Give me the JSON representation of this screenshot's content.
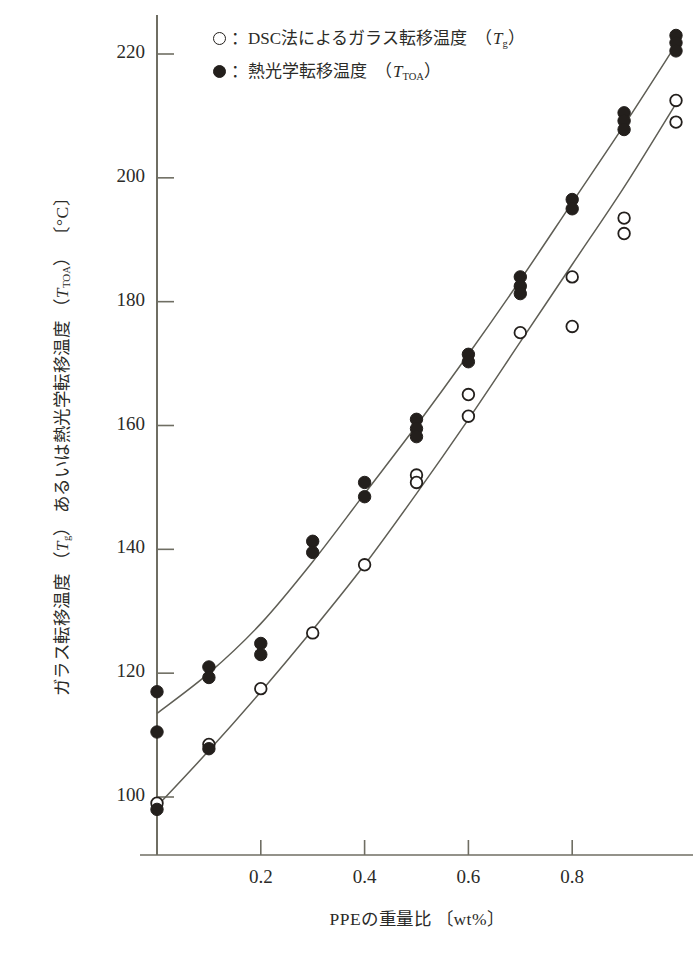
{
  "chart_data": {
    "type": "scatter",
    "title": "",
    "xlabel": "PPEの重量比 〔wt%〕",
    "ylabel": "ガラス転移温度 (Tg) あるいは熱光学転移温度 (TTOA) 〔°C〕",
    "xlim": [
      0.0,
      1.0
    ],
    "ylim": [
      94,
      226
    ],
    "xticks": [
      0.2,
      0.4,
      0.6,
      0.8
    ],
    "xtick_labels": [
      "0.2",
      "0.4",
      "0.6",
      "0.8"
    ],
    "yticks": [
      100,
      120,
      140,
      160,
      180,
      200,
      220
    ],
    "ytick_labels": [
      "100",
      "120",
      "140",
      "160",
      "180",
      "200",
      "220"
    ],
    "grid": false,
    "legend_position": "top-center",
    "series": [
      {
        "name": "DSC法によるガラス転移温度 (Tg)",
        "marker": "open-circle",
        "color": "#231f1c",
        "points": [
          {
            "x": 0.0,
            "y": 99.0
          },
          {
            "x": 0.1,
            "y": 108.5
          },
          {
            "x": 0.2,
            "y": 117.5
          },
          {
            "x": 0.3,
            "y": 126.5
          },
          {
            "x": 0.4,
            "y": 137.5
          },
          {
            "x": 0.5,
            "y": 152.0
          },
          {
            "x": 0.5,
            "y": 150.8
          },
          {
            "x": 0.6,
            "y": 165.0
          },
          {
            "x": 0.6,
            "y": 161.5
          },
          {
            "x": 0.7,
            "y": 175.0
          },
          {
            "x": 0.8,
            "y": 184.0
          },
          {
            "x": 0.8,
            "y": 176.0
          },
          {
            "x": 0.9,
            "y": 193.5
          },
          {
            "x": 0.9,
            "y": 191.0
          },
          {
            "x": 1.0,
            "y": 212.5
          },
          {
            "x": 1.0,
            "y": 209.0
          }
        ]
      },
      {
        "name": "熱光学転移温度 (TTOA)",
        "marker": "filled-circle",
        "color": "#231f1c",
        "points": [
          {
            "x": 0.0,
            "y": 117.0
          },
          {
            "x": 0.0,
            "y": 110.5
          },
          {
            "x": 0.0,
            "y": 98.0
          },
          {
            "x": 0.1,
            "y": 121.0
          },
          {
            "x": 0.1,
            "y": 119.3
          },
          {
            "x": 0.1,
            "y": 107.8
          },
          {
            "x": 0.2,
            "y": 124.8
          },
          {
            "x": 0.2,
            "y": 123.0
          },
          {
            "x": 0.3,
            "y": 141.3
          },
          {
            "x": 0.3,
            "y": 139.5
          },
          {
            "x": 0.4,
            "y": 150.8
          },
          {
            "x": 0.4,
            "y": 148.5
          },
          {
            "x": 0.5,
            "y": 161.0
          },
          {
            "x": 0.5,
            "y": 159.5
          },
          {
            "x": 0.5,
            "y": 158.2
          },
          {
            "x": 0.6,
            "y": 171.5
          },
          {
            "x": 0.6,
            "y": 170.3
          },
          {
            "x": 0.7,
            "y": 184.0
          },
          {
            "x": 0.7,
            "y": 182.5
          },
          {
            "x": 0.7,
            "y": 181.3
          },
          {
            "x": 0.8,
            "y": 196.5
          },
          {
            "x": 0.8,
            "y": 195.0
          },
          {
            "x": 0.9,
            "y": 210.5
          },
          {
            "x": 0.9,
            "y": 209.2
          },
          {
            "x": 0.9,
            "y": 207.8
          },
          {
            "x": 1.0,
            "y": 223.0
          },
          {
            "x": 1.0,
            "y": 221.8
          },
          {
            "x": 1.0,
            "y": 220.5
          }
        ]
      }
    ],
    "fit_curves": [
      {
        "name": "TTOA-fit",
        "points": [
          {
            "x": 0.0,
            "y": 113.5
          },
          {
            "x": 0.1,
            "y": 120.0
          },
          {
            "x": 0.2,
            "y": 128.0
          },
          {
            "x": 0.3,
            "y": 138.0
          },
          {
            "x": 0.4,
            "y": 149.0
          },
          {
            "x": 0.5,
            "y": 160.0
          },
          {
            "x": 0.6,
            "y": 171.5
          },
          {
            "x": 0.7,
            "y": 183.5
          },
          {
            "x": 0.8,
            "y": 196.0
          },
          {
            "x": 0.9,
            "y": 208.5
          },
          {
            "x": 1.0,
            "y": 221.5
          }
        ]
      },
      {
        "name": "Tg-fit",
        "points": [
          {
            "x": 0.0,
            "y": 98.5
          },
          {
            "x": 0.1,
            "y": 107.5
          },
          {
            "x": 0.2,
            "y": 117.0
          },
          {
            "x": 0.3,
            "y": 127.0
          },
          {
            "x": 0.4,
            "y": 137.5
          },
          {
            "x": 0.5,
            "y": 149.0
          },
          {
            "x": 0.6,
            "y": 161.0
          },
          {
            "x": 0.7,
            "y": 173.5
          },
          {
            "x": 0.8,
            "y": 186.0
          },
          {
            "x": 0.9,
            "y": 198.5
          },
          {
            "x": 1.0,
            "y": 212.0
          }
        ]
      }
    ]
  },
  "legend": {
    "items": [
      {
        "marker": "open",
        "label": "：DSC法によるガラス転移温度 （Tg）"
      },
      {
        "marker": "filled",
        "label": "：熱光学転移温度 （TTOA）"
      }
    ]
  },
  "axis": {
    "y_title_part1": "ガラス転移温度 (",
    "y_title_tg": "T",
    "y_title_tg_sub": "g",
    "y_title_part2": ") あるいは熱光学転移温度 (",
    "y_title_ttoa": "T",
    "y_title_ttoa_sub": "TOA",
    "y_title_part3": ") 〔°C〕",
    "x_title": "PPEの重量比 〔wt%〕"
  }
}
